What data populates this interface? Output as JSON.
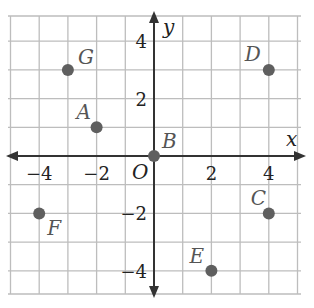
{
  "chart_data": {
    "type": "scatter",
    "title": "",
    "xlabel": "x",
    "ylabel": "y",
    "origin_label": "O",
    "xlim": [
      -5,
      5
    ],
    "ylim": [
      -5,
      5
    ],
    "grid": true,
    "x_ticks": [
      -4,
      -2,
      2,
      4
    ],
    "y_ticks": [
      4,
      2,
      -2,
      -4
    ],
    "x_tick_labels": [
      "−4",
      "−2",
      "2",
      "4"
    ],
    "y_tick_labels": [
      "4",
      "2",
      "−2",
      "−4"
    ],
    "points": [
      {
        "label": "A",
        "x": -2,
        "y": 1
      },
      {
        "label": "B",
        "x": 0,
        "y": 0
      },
      {
        "label": "C",
        "x": 4,
        "y": -2
      },
      {
        "label": "D",
        "x": 4,
        "y": 3
      },
      {
        "label": "E",
        "x": 2,
        "y": -4
      },
      {
        "label": "F",
        "x": -4,
        "y": -2
      },
      {
        "label": "G",
        "x": -3,
        "y": 3
      }
    ]
  },
  "colors": {
    "grid": "#bdbdbd",
    "axis": "#333333",
    "point": "#5f5f5f",
    "point_label": "#555555"
  }
}
